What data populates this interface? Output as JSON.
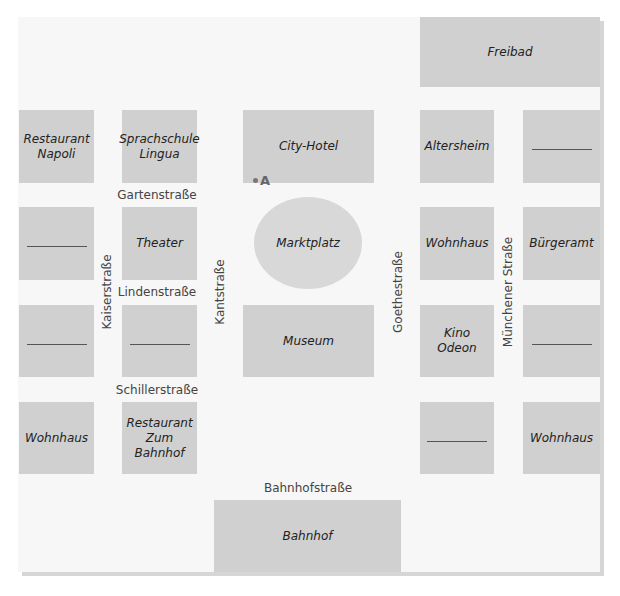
{
  "map": {
    "background": "#f7f7f7",
    "block_color": "#d0d0d0",
    "buildings": {
      "freibad": "Freibad",
      "restaurant_napoli": "Restaurant\nNapoli",
      "sprachschule": "Sprachschule\nLingua",
      "city_hotel": "City-Hotel",
      "altersheim": "Altersheim",
      "theater": "Theater",
      "marktplatz": "Marktplatz",
      "wohnhaus_goethe": "Wohnhaus",
      "buergeramt": "Bürgeramt",
      "museum": "Museum",
      "kino_odeon": "Kino Odeon",
      "wohnhaus_kaiser": "Wohnhaus",
      "restaurant_bahnhof": "Restaurant\nZum Bahnhof",
      "wohnhaus_muenchener": "Wohnhaus",
      "bahnhof": "Bahnhof"
    },
    "streets": {
      "gartenstrasse": "Gartenstraße",
      "lindenstrasse": "Lindenstraße",
      "schillerstrasse": "Schillerstraße",
      "bahnhofstrasse": "Bahnhofstraße",
      "kaiserstrasse": "Kaiserstraße",
      "kantstrasse": "Kantstraße",
      "goethestrasse": "Goethestraße",
      "muenchener_strasse": "Münchener Straße"
    },
    "marker": {
      "label": "A"
    }
  }
}
